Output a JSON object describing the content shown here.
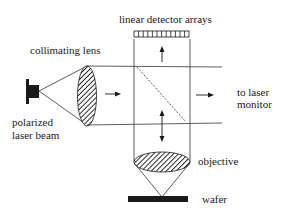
{
  "labels": {
    "detector": "linear detector arrays",
    "collimating_lens": "collimating lens",
    "to_laser_line1": "to laser",
    "to_laser_line2": "monitor",
    "polarized_line1": "polarized",
    "polarized_line2": "laser beam",
    "objective": "objective",
    "wafer": "wafer"
  },
  "colors": {
    "ink": "#1a1a1a",
    "background": "#ffffff"
  }
}
